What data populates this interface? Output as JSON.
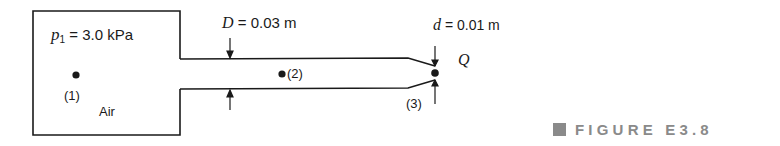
{
  "figure": {
    "caption": "FIGURE E3.8",
    "caption_color": "#8a8a8a",
    "line_color": "#1a1a1a"
  },
  "labels": {
    "p1_symbol": "p",
    "p1_sub": "1",
    "p1_value": " = 3.0  kPa",
    "point1": "(1)",
    "air": "Air",
    "D_symbol": "D",
    "D_value": " = 0.03 m",
    "point2": "(2)",
    "d_symbol": "d",
    "d_value": " = 0.01 m",
    "Q": "Q",
    "point3": "(3)"
  }
}
